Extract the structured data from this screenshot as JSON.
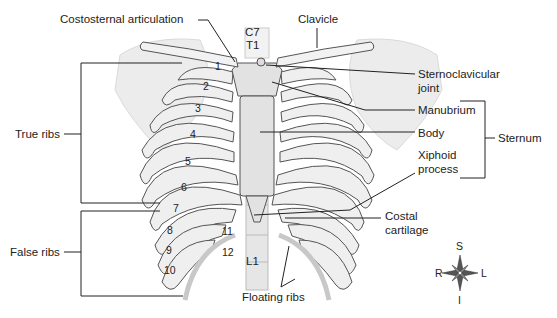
{
  "diagram": {
    "labels": {
      "costosternal_articulation": "Costosternal articulation",
      "clavicle": "Clavicle",
      "c7": "C7",
      "t1": "T1",
      "sternoclavicular_joint_line1": "Sternoclavicular",
      "sternoclavicular_joint_line2": "joint",
      "manubrium": "Manubrium",
      "body": "Body",
      "xiphoid_line1": "Xiphoid",
      "xiphoid_line2": "process",
      "sternum": "Sternum",
      "true_ribs": "True ribs",
      "false_ribs": "False ribs",
      "costal_cartilage_line1": "Costal",
      "costal_cartilage_line2": "cartilage",
      "floating_ribs": "Floating ribs",
      "l1": "L1"
    },
    "rib_numbers": [
      "1",
      "2",
      "3",
      "4",
      "5",
      "6",
      "7",
      "8",
      "9",
      "10",
      "11",
      "12"
    ],
    "compass": {
      "superior": "S",
      "inferior": "I",
      "right": "R",
      "left": "L"
    }
  }
}
